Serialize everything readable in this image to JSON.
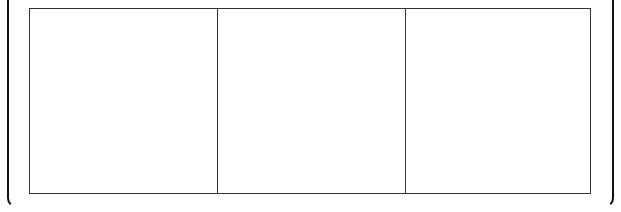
{
  "diagram": {
    "frame": {
      "stroke_color": "#111111"
    },
    "panels": [
      {
        "label": "",
        "width": 187
      },
      {
        "label": "",
        "width": 188
      },
      {
        "label": "",
        "width": 185
      }
    ],
    "panel_border_color": "#333333"
  }
}
